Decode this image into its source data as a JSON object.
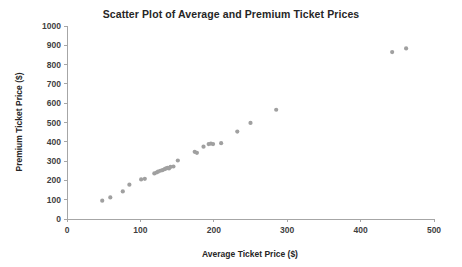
{
  "chart_data": {
    "type": "scatter",
    "title": "Scatter Plot of Average and Premium Ticket Prices",
    "xlabel": "Average Ticket Price ($)",
    "ylabel": "Premium Ticket Price ($)",
    "xlim": [
      0,
      500
    ],
    "ylim": [
      0,
      1000
    ],
    "xticks": [
      0,
      100,
      200,
      300,
      400,
      500
    ],
    "yticks": [
      0,
      100,
      200,
      300,
      400,
      500,
      600,
      700,
      800,
      900,
      1000
    ],
    "grid": false,
    "legend": null,
    "marker_color": "#a0a0a0",
    "marker_size": 2.1,
    "series": [
      {
        "name": "Ticket prices",
        "points": [
          [
            48,
            95
          ],
          [
            59,
            112
          ],
          [
            76,
            143
          ],
          [
            85,
            178
          ],
          [
            101,
            205
          ],
          [
            106,
            208
          ],
          [
            119,
            236
          ],
          [
            122,
            241
          ],
          [
            124,
            245
          ],
          [
            127,
            250
          ],
          [
            130,
            253
          ],
          [
            133,
            258
          ],
          [
            135,
            262
          ],
          [
            137,
            265
          ],
          [
            139,
            262
          ],
          [
            141,
            270
          ],
          [
            145,
            272
          ],
          [
            151,
            303
          ],
          [
            174,
            348
          ],
          [
            177,
            343
          ],
          [
            186,
            375
          ],
          [
            193,
            388
          ],
          [
            196,
            391
          ],
          [
            199,
            388
          ],
          [
            210,
            393
          ],
          [
            232,
            453
          ],
          [
            250,
            498
          ],
          [
            285,
            566
          ],
          [
            443,
            865
          ],
          [
            462,
            884
          ]
        ]
      }
    ]
  },
  "axes": {
    "x_tick_labels": [
      "0",
      "100",
      "200",
      "300",
      "400",
      "500"
    ],
    "y_tick_labels": [
      "0",
      "100",
      "200",
      "300",
      "400",
      "500",
      "600",
      "700",
      "800",
      "900",
      "1000"
    ]
  }
}
